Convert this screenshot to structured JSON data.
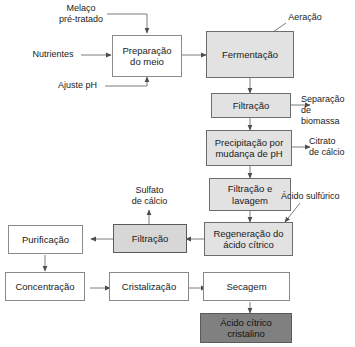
{
  "diagram": {
    "language": "pt-BR",
    "type": "process-flowchart",
    "colors": {
      "background": "#ffffff",
      "node_white_fill": "#ffffff",
      "node_light_fill": "#e2e2e2",
      "node_mid_fill": "#d7d7d7",
      "node_dark_fill": "#808080",
      "border": "#6d6d6d",
      "text": "#1a1a1a",
      "arrow": "#4d4d4d"
    },
    "nodes": [
      {
        "id": "preparacao",
        "label": "Preparação\ndo meio",
        "style": "white"
      },
      {
        "id": "fermentacao",
        "label": "Fermentação",
        "style": "light"
      },
      {
        "id": "filtracao1",
        "label": "Filtração",
        "style": "light"
      },
      {
        "id": "precipitacao",
        "label": "Precipitação por\nmudança de pH",
        "style": "light"
      },
      {
        "id": "filtracao_lavagem",
        "label": "Filtração e\nlavagem",
        "style": "light"
      },
      {
        "id": "regeneracao",
        "label": "Regeneração do\nácido cítrico",
        "style": "light"
      },
      {
        "id": "filtracao2",
        "label": "Filtração",
        "style": "mid"
      },
      {
        "id": "purificacao",
        "label": "Purificação",
        "style": "white"
      },
      {
        "id": "concentracao",
        "label": "Concentração",
        "style": "white"
      },
      {
        "id": "cristalizacao",
        "label": "Cristalização",
        "style": "white"
      },
      {
        "id": "secagem",
        "label": "Secagem",
        "style": "white"
      },
      {
        "id": "produto_final",
        "label": "Ácido cítrico\ncristalino",
        "style": "dark"
      }
    ],
    "annotations": [
      {
        "id": "melaco",
        "label": "Melaço\npré-tratado",
        "kind": "input"
      },
      {
        "id": "nutrientes",
        "label": "Nutrientes",
        "kind": "input"
      },
      {
        "id": "ajuste_ph",
        "label": "Ajuste pH",
        "kind": "input"
      },
      {
        "id": "aeracao",
        "label": "Aeração",
        "kind": "input"
      },
      {
        "id": "separacao_biomassa",
        "label": "Separação de\nbiomassa",
        "kind": "output"
      },
      {
        "id": "citrato_calcio",
        "label": "Citrato\nde cálcio",
        "kind": "output"
      },
      {
        "id": "acido_sulfurico",
        "label": "Ácido sulfúrico",
        "kind": "input"
      },
      {
        "id": "sulfato_calcio",
        "label": "Sulfato\nde cálcio",
        "kind": "output"
      }
    ],
    "edges": [
      {
        "from": "melaco",
        "to": "preparacao"
      },
      {
        "from": "nutrientes",
        "to": "preparacao"
      },
      {
        "from": "ajuste_ph",
        "to": "preparacao"
      },
      {
        "from": "preparacao",
        "to": "fermentacao"
      },
      {
        "from": "aeracao",
        "to": "fermentacao"
      },
      {
        "from": "fermentacao",
        "to": "filtracao1"
      },
      {
        "from": "filtracao1",
        "to": "separacao_biomassa"
      },
      {
        "from": "filtracao1",
        "to": "precipitacao"
      },
      {
        "from": "precipitacao",
        "to": "citrato_calcio"
      },
      {
        "from": "precipitacao",
        "to": "filtracao_lavagem"
      },
      {
        "from": "filtracao_lavagem",
        "to": "regeneracao"
      },
      {
        "from": "acido_sulfurico",
        "to": "regeneracao"
      },
      {
        "from": "regeneracao",
        "to": "filtracao2"
      },
      {
        "from": "filtracao2",
        "to": "sulfato_calcio"
      },
      {
        "from": "filtracao2",
        "to": "purificacao"
      },
      {
        "from": "purificacao",
        "to": "concentracao"
      },
      {
        "from": "concentracao",
        "to": "cristalizacao"
      },
      {
        "from": "cristalizacao",
        "to": "secagem"
      },
      {
        "from": "secagem",
        "to": "produto_final"
      }
    ]
  }
}
